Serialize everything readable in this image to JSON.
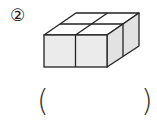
{
  "problem": {
    "number_label": "②",
    "figure": {
      "description": "isometric block of 4 unit cubes arranged 2x2 (2 wide, 2 deep, 1 high)",
      "face_color": "#ebebeb",
      "side_color": "#e2e2e2",
      "top_color": "#ffffff",
      "stroke_color": "#222222"
    },
    "answer": {
      "open_paren": "(",
      "close_paren": ")",
      "value": ""
    }
  }
}
